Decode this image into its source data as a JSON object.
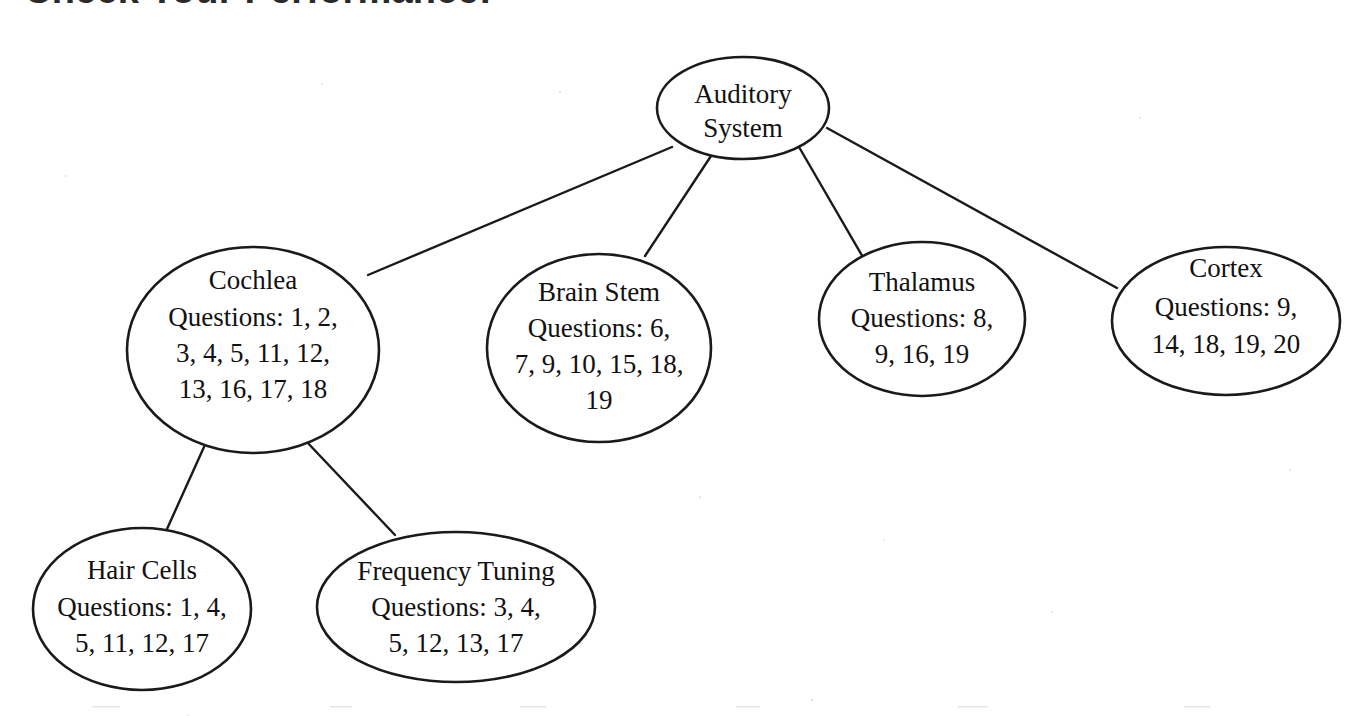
{
  "page": {
    "title": "Check Your Performance!",
    "background_color": "#ffffff",
    "stroke_color": "#1a1a1a",
    "text_color": "#111111"
  },
  "diagram": {
    "type": "tree",
    "orientation": "top-down",
    "node_shape": "ellipse",
    "nodes": [
      {
        "id": "auditory-system",
        "title": "Auditory",
        "title2": "System",
        "questions_label": "",
        "questions": [],
        "cx": 743,
        "cy": 108,
        "rx": 86,
        "ry": 51
      },
      {
        "id": "cochlea",
        "title": "Cochlea",
        "questions_label": "Questions: 1, 2,",
        "questions_line2": "3, 4, 5, 11, 12,",
        "questions_line3": "13, 16, 17, 18",
        "questions": [
          1,
          2,
          3,
          4,
          5,
          11,
          12,
          13,
          16,
          17,
          18
        ],
        "cx": 253,
        "cy": 350,
        "rx": 126,
        "ry": 103
      },
      {
        "id": "brain-stem",
        "title": "Brain Stem",
        "questions_label": "Questions: 6,",
        "questions_line2": "7, 9, 10, 15, 18,",
        "questions_line3": "19",
        "questions": [
          6,
          7,
          9,
          10,
          15,
          18,
          19
        ],
        "cx": 599,
        "cy": 348,
        "rx": 112,
        "ry": 94
      },
      {
        "id": "thalamus",
        "title": "Thalamus",
        "questions_label": "Questions: 8,",
        "questions_line2": "9, 16, 19",
        "questions_line3": "",
        "questions": [
          8,
          9,
          16,
          19
        ],
        "cx": 922,
        "cy": 319,
        "rx": 103,
        "ry": 77
      },
      {
        "id": "cortex",
        "title": "Cortex",
        "questions_label": "Questions: 9,",
        "questions_line2": "14, 18, 19, 20",
        "questions_line3": "",
        "questions": [
          9,
          14,
          18,
          19,
          20
        ],
        "cx": 1226,
        "cy": 321,
        "rx": 114,
        "ry": 74
      },
      {
        "id": "hair-cells",
        "title": "Hair Cells",
        "questions_label": "Questions: 1, 4,",
        "questions_line2": "5, 11, 12, 17",
        "questions_line3": "",
        "questions": [
          1,
          4,
          5,
          11,
          12,
          17
        ],
        "cx": 142,
        "cy": 609,
        "rx": 109,
        "ry": 81
      },
      {
        "id": "frequency-tuning",
        "title": "Frequency Tuning",
        "questions_label": "Questions: 3, 4,",
        "questions_line2": "5, 12, 13, 17",
        "questions_line3": "",
        "questions": [
          3,
          4,
          5,
          12,
          13,
          17
        ],
        "cx": 456,
        "cy": 607,
        "rx": 139,
        "ry": 75
      }
    ],
    "edges": [
      {
        "from": "auditory-system",
        "to": "cochlea",
        "x1": 672,
        "y1": 147,
        "x2": 368,
        "y2": 275
      },
      {
        "from": "auditory-system",
        "to": "brain-stem",
        "x1": 711,
        "y1": 156,
        "x2": 645,
        "y2": 256
      },
      {
        "from": "auditory-system",
        "to": "thalamus",
        "x1": 799,
        "y1": 147,
        "x2": 864,
        "y2": 259
      },
      {
        "from": "auditory-system",
        "to": "cortex",
        "x1": 827,
        "y1": 128,
        "x2": 1117,
        "y2": 288
      },
      {
        "from": "cochlea",
        "to": "hair-cells",
        "x1": 204,
        "y1": 447,
        "x2": 167,
        "y2": 529
      },
      {
        "from": "cochlea",
        "to": "frequency-tuning",
        "x1": 305,
        "y1": 440,
        "x2": 395,
        "y2": 535
      }
    ]
  }
}
